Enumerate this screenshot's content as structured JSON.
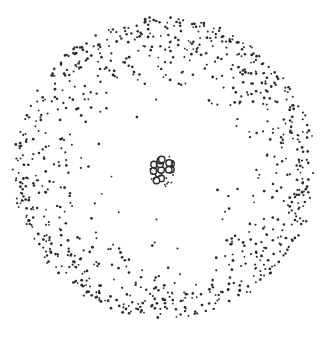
{
  "diagram": {
    "canvas": {
      "width": 328,
      "height": 339,
      "background": "#ffffff"
    },
    "dot_color": "#2a2a2a",
    "electron_cloud": {
      "center": [
        164,
        168
      ],
      "radius": 150,
      "dot_count": 900,
      "dot_radius": 1.1,
      "edge_concentration": 6
    },
    "nucleus": {
      "center": [
        163,
        171
      ],
      "radius_x": 11,
      "radius_y": 15,
      "cluster_count": 14,
      "cluster_radius": 3.2
    }
  }
}
